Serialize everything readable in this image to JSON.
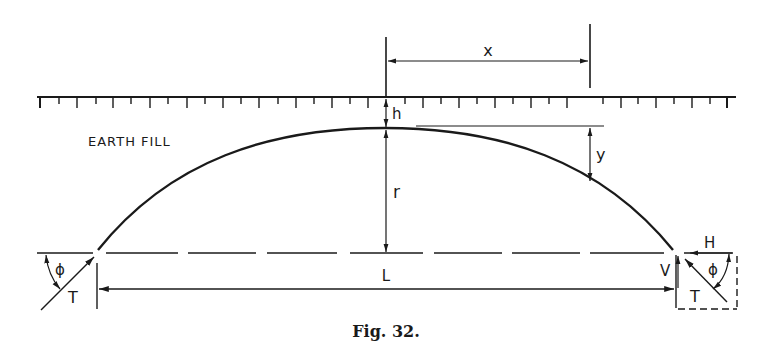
{
  "figure": {
    "caption": "Fig. 32.",
    "region_label": "EARTH FILL"
  },
  "dimensions": {
    "x": "x",
    "y": "y",
    "h": "h",
    "r": "r",
    "L": "L"
  },
  "forces": {
    "left_thrust": "T",
    "left_angle": "ϕ",
    "right_thrust": "T",
    "right_angle": "ϕ",
    "horizontal": "H",
    "vertical": "V"
  },
  "colors": {
    "ink": "#1a1a1a",
    "paper": "#ffffff"
  }
}
